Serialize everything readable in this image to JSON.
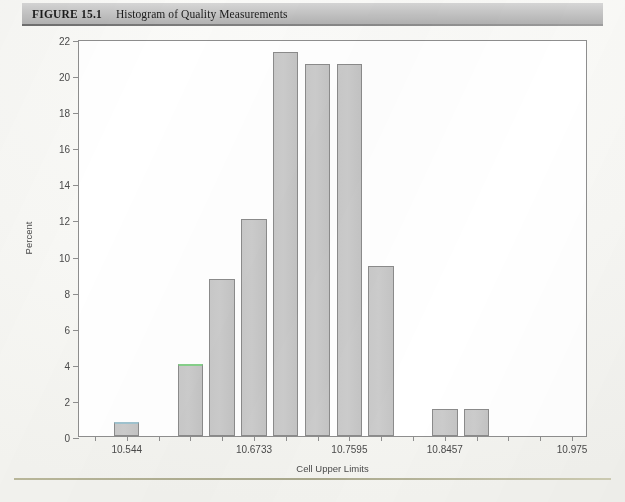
{
  "header": {
    "figure_number": "FIGURE 15.1",
    "figure_title": "Histogram of Quality Measurements"
  },
  "chart_data": {
    "type": "bar",
    "title": "Histogram of Quality Measurements",
    "xlabel": "Cell Upper Limits",
    "ylabel": "Percent",
    "ylim": [
      0,
      22
    ],
    "ytick_values": [
      0,
      2,
      4,
      6,
      8,
      10,
      12,
      14,
      16,
      18,
      20,
      22
    ],
    "ytick_labels": [
      "0",
      "2",
      "4",
      "6",
      "8",
      "10",
      "12",
      "14",
      "16",
      "18",
      "20",
      "22"
    ],
    "xtick_labels": [
      "10.544",
      "10.6733",
      "10.7595",
      "10.8457",
      "10.975"
    ],
    "xtick_positions": [
      1,
      5,
      8,
      11,
      15
    ],
    "grid": false,
    "legend": null,
    "bin_count": 16,
    "categories": [
      "10.5009",
      "10.544",
      "10.5871",
      "10.6302",
      "10.6733",
      "10.7164",
      "10.7595",
      "10.8026",
      "10.8457",
      "10.8888",
      "10.9319",
      "10.975"
    ],
    "bars": [
      {
        "bin_index": 1,
        "value": 0.8,
        "edge_tint": "blue"
      },
      {
        "bin_index": 2,
        "value": 0.0,
        "edge_tint": "none"
      },
      {
        "bin_index": 3,
        "value": 4.0,
        "edge_tint": "green"
      },
      {
        "bin_index": 4,
        "value": 8.7,
        "edge_tint": "none"
      },
      {
        "bin_index": 5,
        "value": 12.0,
        "edge_tint": "none"
      },
      {
        "bin_index": 6,
        "value": 21.3,
        "edge_tint": "none"
      },
      {
        "bin_index": 7,
        "value": 20.6,
        "edge_tint": "none"
      },
      {
        "bin_index": 8,
        "value": 20.6,
        "edge_tint": "none"
      },
      {
        "bin_index": 9,
        "value": 9.4,
        "edge_tint": "none"
      },
      {
        "bin_index": 10,
        "value": 0.0,
        "edge_tint": "none"
      },
      {
        "bin_index": 11,
        "value": 1.5,
        "edge_tint": "none"
      },
      {
        "bin_index": 12,
        "value": 1.5,
        "edge_tint": "none"
      }
    ],
    "values": [
      0.8,
      0,
      4.0,
      8.7,
      12.0,
      21.3,
      20.6,
      20.6,
      9.4,
      0,
      1.5,
      1.5
    ],
    "bar_fill_color": "#c9c9c9",
    "bar_border_color": "#8b8b8b"
  }
}
